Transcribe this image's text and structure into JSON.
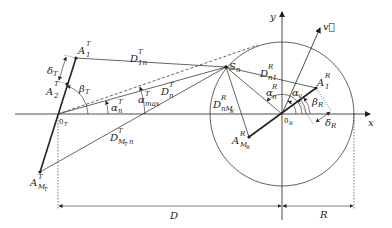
{
  "diagram": {
    "type": "geometry-schematic",
    "axes": {
      "x_label": "x",
      "y_label": "y"
    },
    "origins": {
      "transmitter": {
        "base": "0",
        "sub": "T"
      },
      "receiver": {
        "base": "0",
        "sub": "R"
      }
    },
    "points": {
      "A1T": {
        "base": "A",
        "sup": "T",
        "sub": "1"
      },
      "A2T": {
        "base": "A",
        "sup": "T",
        "sub": "2"
      },
      "AMT": {
        "base": "A",
        "sup": "T",
        "sub": "M",
        "subsub": "T"
      },
      "Sn": {
        "base": "S",
        "sub": "n"
      },
      "A1R": {
        "base": "A",
        "sup": "R",
        "sub": "1"
      },
      "AMR": {
        "base": "A",
        "sup": "R",
        "sub": "M",
        "subsub": "R"
      }
    },
    "distances": {
      "D1nT": {
        "base": "D",
        "sup": "T",
        "sub": "1n"
      },
      "DnT": {
        "base": "D",
        "sup": "T",
        "sub": "n"
      },
      "DMTnT": {
        "base": "D",
        "sup": "T",
        "sub": "M",
        "subsub": "T",
        "sub2": "n"
      },
      "Dn1R": {
        "base": "D",
        "sup": "R",
        "sub": "n1"
      },
      "DnMRR": {
        "base": "D",
        "sup": "R",
        "sub": "nM",
        "subsub": "R"
      }
    },
    "angles": {
      "alpha_nT": {
        "base": "α",
        "sup": "T",
        "sub": "n"
      },
      "alpha_maxT": {
        "base": "α",
        "sup": "T",
        "sub": "max"
      },
      "beta_T": {
        "base": "β",
        "sub": "T"
      },
      "alpha_nR": {
        "base": "α",
        "sup": "R",
        "sub": "n"
      },
      "alpha_v": {
        "base": "α",
        "sub": "v"
      },
      "beta_R": {
        "base": "β",
        "sub": "R"
      }
    },
    "spacings": {
      "delta_T": {
        "base": "δ",
        "sub": "T"
      },
      "delta_R": {
        "base": "δ",
        "sub": "R"
      }
    },
    "velocity": {
      "label": "v⃗"
    },
    "dimensions": {
      "D": "D",
      "R": "R"
    },
    "colors": {
      "stroke": "#222222",
      "background": "#ffffff"
    }
  }
}
